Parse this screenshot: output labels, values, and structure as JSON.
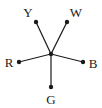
{
  "diagram": {
    "type": "star-graph",
    "center": {
      "x": 51,
      "y": 54
    },
    "nodes": [
      {
        "id": "Y",
        "label": "Y",
        "x": 36,
        "y": 22,
        "lx": 28,
        "ly": 17
      },
      {
        "id": "W",
        "label": "W",
        "x": 67,
        "y": 22,
        "lx": 76,
        "ly": 17
      },
      {
        "id": "R",
        "label": "R",
        "x": 19,
        "y": 62,
        "lx": 9,
        "ly": 67
      },
      {
        "id": "B",
        "label": "B",
        "x": 83,
        "y": 62,
        "lx": 93,
        "ly": 68
      },
      {
        "id": "G",
        "label": "G",
        "x": 51,
        "y": 87,
        "lx": 51,
        "ly": 104
      }
    ],
    "colors": {
      "stroke": "#1a1a1a",
      "background": "#ffffff"
    }
  }
}
